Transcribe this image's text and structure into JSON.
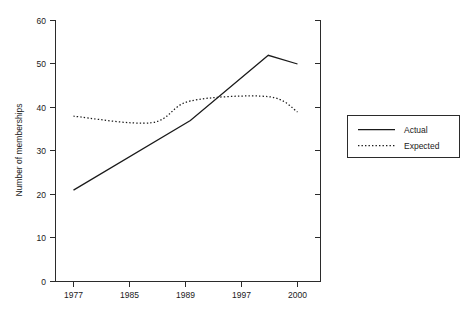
{
  "chart_data": {
    "type": "line",
    "title": "",
    "xlabel": "",
    "ylabel": "Number of memberships",
    "categories": [
      "1977",
      "1985",
      "1989",
      "1997",
      "2000"
    ],
    "x_positions": [
      1977,
      1985,
      1989,
      1997,
      2000
    ],
    "ylim": [
      0,
      60
    ],
    "yticks": [
      0,
      10,
      20,
      30,
      40,
      50,
      60
    ],
    "ytick_labels": [
      "0",
      "10",
      "20",
      "30",
      "40",
      "50",
      "60"
    ],
    "grid": false,
    "legend_position": "right-outside",
    "series": [
      {
        "name": "Actual",
        "style": "solid",
        "color": "#1a1a1a",
        "values": [
          21,
          28.5,
          37,
          52,
          50
        ]
      },
      {
        "name": "Expected",
        "style": "dotted",
        "color": "#1a1a1a",
        "values": [
          38,
          36.5,
          41.5,
          42.5,
          39
        ]
      }
    ]
  },
  "axes": {
    "y_axis_label": "Number of memberships",
    "y_tick_labels": [
      "60",
      "50",
      "40",
      "30",
      "20",
      "10",
      "0"
    ],
    "x_tick_labels": [
      "1977",
      "1985",
      "1989",
      "1997",
      "2000"
    ]
  },
  "legend": {
    "entries": [
      {
        "label": "Actual",
        "style": "solid"
      },
      {
        "label": "Expected",
        "style": "dotted"
      }
    ]
  }
}
